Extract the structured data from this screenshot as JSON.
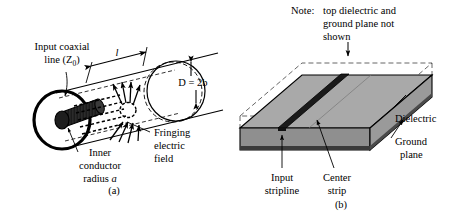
{
  "figure": {
    "type": "technical-diagram",
    "panels": [
      {
        "id": "a",
        "caption": "(a)",
        "labels": {
          "input_coaxial_line_1": "Input coaxial",
          "input_coaxial_line_2": "line (Z",
          "input_coaxial_sub": "0",
          "input_coaxial_close": ")",
          "length_symbol": "l",
          "diameter_label": "D = 2b",
          "inner_conductor_1": "Inner",
          "inner_conductor_2": "conductor",
          "inner_conductor_3": "radius ",
          "inner_conductor_italic": "a",
          "fringing_1": "Fringing",
          "fringing_2": "electric",
          "fringing_3": "field"
        }
      },
      {
        "id": "b",
        "caption": "(b)",
        "labels": {
          "note_prefix": "Note:",
          "note_line1": "top dielectric and",
          "note_line2": "ground plane not",
          "note_line3": "shown",
          "dielectric": "Dielectric",
          "ground_plane_1": "Ground",
          "ground_plane_2": "plane",
          "input_stripline_1": "Input",
          "input_stripline_2": "stripline",
          "center_strip_1": "Center",
          "center_strip_2": "strip"
        }
      }
    ]
  },
  "colors": {
    "line": "#000000",
    "background": "#ffffff",
    "dielectric_top": "#a9a9a9",
    "dielectric_front": "#8f8f8f",
    "dielectric_side": "#9a9a9a",
    "center_strip": "#1a1a1a",
    "inner_conductor": "#2b2b2b"
  }
}
